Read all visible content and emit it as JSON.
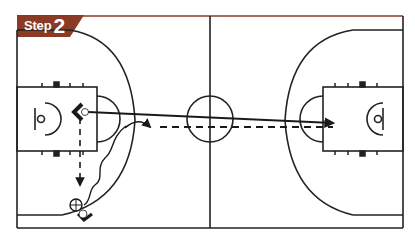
{
  "header": {
    "step_word": "Step",
    "step_number": "2",
    "tab_color": "#8b3a26",
    "border_color": "#8b3a26"
  },
  "court": {
    "line_color": "#222222",
    "left": 17,
    "right": 403,
    "top": 24,
    "bottom": 228,
    "inner_top": 30,
    "inner_bottom": 215,
    "half_court_x": 210,
    "center_circle": {
      "cx": 210,
      "cy": 119,
      "r": 23
    },
    "left_key": {
      "x": 17,
      "y": 87,
      "w": 80,
      "h": 64
    },
    "right_key": {
      "x": 323,
      "y": 87,
      "w": 80,
      "h": 64
    }
  },
  "players": [
    {
      "id": "offense-left-wing",
      "type": "offensive-player",
      "x": 80,
      "y": 112
    },
    {
      "id": "ball-handler-corner",
      "type": "offensive-player-with-ball",
      "x": 79,
      "y": 211
    }
  ],
  "actions": [
    {
      "id": "pass",
      "type": "pass",
      "style": "solid-arrow",
      "from": [
        88,
        112
      ],
      "to": [
        333,
        123
      ]
    },
    {
      "id": "cut",
      "type": "cut",
      "style": "dashed-arrow",
      "from": [
        157,
        127
      ],
      "to": [
        333,
        127
      ]
    },
    {
      "id": "dribble",
      "type": "dribble",
      "style": "wavy-line"
    },
    {
      "id": "screen-cut",
      "type": "cut",
      "style": "dashed-arrow-down",
      "from": [
        80,
        117
      ],
      "to": [
        80,
        185
      ]
    }
  ],
  "colors": {
    "ink": "#1a1a1a",
    "accent": "#8b3a26",
    "background": "#ffffff"
  }
}
